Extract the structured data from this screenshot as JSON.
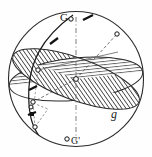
{
  "figure": {
    "type": "geometric-sphere-diagram",
    "background_color": "#fefefe",
    "line_color": "#1f1f1f",
    "hatch_color": "#3a3a3a",
    "dash_color": "#666666",
    "labels": [
      {
        "id": "G",
        "text": "G",
        "role": "north-pole-label"
      },
      {
        "id": "Gp",
        "text": "G'",
        "role": "south-pole-label"
      },
      {
        "id": "g",
        "text": "g",
        "role": "plane-label"
      }
    ],
    "sphere": {
      "center_x": 76,
      "center_y": 79,
      "radius": 68
    },
    "axis": {
      "name": "polar-axis",
      "style": "dash-dot",
      "from": {
        "x": 76,
        "y": 16
      },
      "to": {
        "x": 76,
        "y": 142
      }
    },
    "planes": [
      {
        "name": "plane-horizontal-hatched",
        "hatch": "horizontal",
        "tilt_deg": -8,
        "label": null
      },
      {
        "name": "plane-diagonal-hatched",
        "hatch": "diagonal",
        "tilt_deg": 22,
        "label": "g"
      }
    ],
    "markers": [
      {
        "name": "pole-marker-G",
        "x": 71,
        "y": 18,
        "kind": "open-circle"
      },
      {
        "name": "pole-marker-Gp",
        "x": 67,
        "y": 139,
        "kind": "open-circle"
      },
      {
        "name": "center-marker",
        "x": 76,
        "y": 79,
        "kind": "open-circle"
      },
      {
        "name": "node-marker-right",
        "x": 117,
        "y": 33,
        "kind": "open-circle"
      },
      {
        "name": "node-marker-upper-l",
        "x": 38,
        "y": 70,
        "kind": "open-circle"
      },
      {
        "name": "node-marker-lower-l",
        "x": 34,
        "y": 101,
        "kind": "open-circle"
      },
      {
        "name": "node-marker-outer-l",
        "x": 31,
        "y": 106,
        "kind": "open-circle"
      },
      {
        "name": "node-marker-below",
        "x": 35,
        "y": 127,
        "kind": "open-circle"
      }
    ],
    "ticks": [
      {
        "name": "tick-meridian-upper",
        "x": 54,
        "y": 41
      },
      {
        "name": "tick-meridian-mid",
        "x": 33,
        "y": 88
      },
      {
        "name": "tick-meridian-lower",
        "x": 32,
        "y": 113
      },
      {
        "name": "tick-top-arrow",
        "x": 88,
        "y": 17
      }
    ]
  }
}
